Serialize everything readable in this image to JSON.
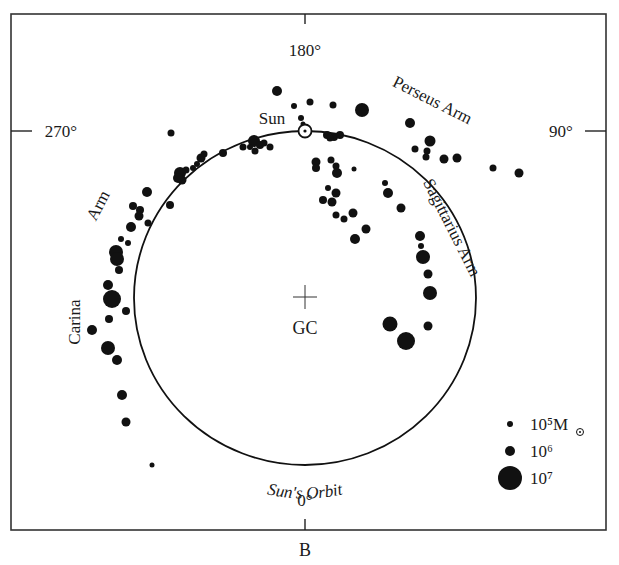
{
  "figure": {
    "panel_label": "B",
    "frame": {
      "x": 11,
      "y": 14,
      "width": 595,
      "height": 516
    },
    "colors": {
      "ink": "#111111",
      "background": "#ffffff",
      "frame": "#333333"
    }
  },
  "axes": {
    "top": {
      "label": "180°",
      "tick": {
        "x": 305,
        "y1": 14,
        "y2": 24
      },
      "text_x": 305,
      "text_y": 56
    },
    "left": {
      "label": "270°",
      "tick": {
        "y": 131,
        "x1": 11,
        "x2": 32
      },
      "text_x": 61,
      "text_y": 137
    },
    "right": {
      "label": "90°",
      "tick": {
        "y": 131,
        "x1": 585,
        "x2": 606
      },
      "text_x": 561,
      "text_y": 137
    },
    "bottom": {
      "label": "0°",
      "tick": {
        "x": 305,
        "y1": 519,
        "y2": 530
      },
      "text_x": 305,
      "text_y": 506
    }
  },
  "orbit": {
    "label": "Sun's Orbit",
    "cx": 305,
    "cy": 298,
    "rx": 171,
    "ry": 167
  },
  "galactic_center": {
    "label": "GC",
    "x": 305,
    "y": 297,
    "arm": 12
  },
  "sun": {
    "label": "Sun",
    "x": 305,
    "y": 131,
    "label_x": 272,
    "label_y": 124
  },
  "arm_labels": [
    {
      "id": "perseus",
      "text": "Perseus Arm",
      "x": 430,
      "y": 105,
      "rotate": 27
    },
    {
      "id": "sagittarius",
      "text": "Sagittarius Arm",
      "x": 447,
      "y": 230,
      "rotate": 63
    },
    {
      "id": "carina-arm",
      "text": "Arm",
      "x": 103,
      "y": 208,
      "rotate": -62
    },
    {
      "id": "carina",
      "text": "Carina",
      "x": 80,
      "y": 322,
      "rotate": -90
    }
  ],
  "legend": {
    "unit_symbol": "☉",
    "items": [
      {
        "label": "10⁵M",
        "dot_r": 3,
        "x": 510,
        "y": 424,
        "text_x": 530,
        "text_y": 430
      },
      {
        "label": "10⁶",
        "dot_r": 5,
        "x": 510,
        "y": 451,
        "text_x": 530,
        "text_y": 457
      },
      {
        "label": "10⁷",
        "dot_r": 12,
        "x": 510,
        "y": 478,
        "text_x": 530,
        "text_y": 484
      }
    ]
  },
  "chart_data": {
    "type": "scatter",
    "xlabel": "Galactic longitude (face-on view)",
    "ylabel": "",
    "annotations": [
      "180°",
      "270°",
      "90°",
      "0°",
      "Sun",
      "GC",
      "Sun's Orbit",
      "Perseus Arm",
      "Sagittarius Arm",
      "Carina Arm",
      "B"
    ],
    "legend": [
      {
        "mass": "1e5 Msun",
        "marker_radius": 3
      },
      {
        "mass": "1e6 Msun",
        "marker_radius": 5
      },
      {
        "mass": "1e7 Msun",
        "marker_radius": 12
      }
    ],
    "points": [
      {
        "x": 277,
        "y": 91,
        "r": 5
      },
      {
        "x": 294,
        "y": 106,
        "r": 3
      },
      {
        "x": 310,
        "y": 102,
        "r": 3.5
      },
      {
        "x": 333,
        "y": 105,
        "r": 3.5
      },
      {
        "x": 362,
        "y": 110,
        "r": 7
      },
      {
        "x": 301,
        "y": 118,
        "r": 3
      },
      {
        "x": 303,
        "y": 124,
        "r": 2.5
      },
      {
        "x": 171,
        "y": 133,
        "r": 3.5
      },
      {
        "x": 254,
        "y": 141,
        "r": 6
      },
      {
        "x": 260,
        "y": 145,
        "r": 4
      },
      {
        "x": 264,
        "y": 143,
        "r": 3.5
      },
      {
        "x": 270,
        "y": 147,
        "r": 3.5
      },
      {
        "x": 255,
        "y": 151,
        "r": 3.5
      },
      {
        "x": 250,
        "y": 147,
        "r": 3
      },
      {
        "x": 243,
        "y": 147,
        "r": 3.5
      },
      {
        "x": 223,
        "y": 153,
        "r": 4
      },
      {
        "x": 201,
        "y": 158,
        "r": 4.5
      },
      {
        "x": 204,
        "y": 154,
        "r": 3.5
      },
      {
        "x": 197,
        "y": 164,
        "r": 3
      },
      {
        "x": 193,
        "y": 168,
        "r": 3
      },
      {
        "x": 180,
        "y": 173,
        "r": 6
      },
      {
        "x": 182,
        "y": 180,
        "r": 4.5
      },
      {
        "x": 186,
        "y": 170,
        "r": 3.5
      },
      {
        "x": 178,
        "y": 178,
        "r": 5
      },
      {
        "x": 170,
        "y": 205,
        "r": 4
      },
      {
        "x": 147,
        "y": 192,
        "r": 5
      },
      {
        "x": 133,
        "y": 206,
        "r": 4
      },
      {
        "x": 140,
        "y": 210,
        "r": 4
      },
      {
        "x": 139,
        "y": 216,
        "r": 4.5
      },
      {
        "x": 148,
        "y": 223,
        "r": 3.5
      },
      {
        "x": 131,
        "y": 227,
        "r": 5
      },
      {
        "x": 121,
        "y": 239,
        "r": 3
      },
      {
        "x": 128,
        "y": 243,
        "r": 3
      },
      {
        "x": 116,
        "y": 252,
        "r": 7
      },
      {
        "x": 117,
        "y": 259,
        "r": 7
      },
      {
        "x": 119,
        "y": 270,
        "r": 4
      },
      {
        "x": 108,
        "y": 285,
        "r": 5
      },
      {
        "x": 112,
        "y": 299,
        "r": 9
      },
      {
        "x": 126,
        "y": 311,
        "r": 4
      },
      {
        "x": 109,
        "y": 319,
        "r": 4
      },
      {
        "x": 92,
        "y": 330,
        "r": 5
      },
      {
        "x": 108,
        "y": 348,
        "r": 7
      },
      {
        "x": 117,
        "y": 360,
        "r": 5
      },
      {
        "x": 122,
        "y": 395,
        "r": 5
      },
      {
        "x": 126,
        "y": 422,
        "r": 4.5
      },
      {
        "x": 152,
        "y": 465,
        "r": 2.5
      },
      {
        "x": 327,
        "y": 135,
        "r": 4
      },
      {
        "x": 334,
        "y": 137,
        "r": 4
      },
      {
        "x": 340,
        "y": 135,
        "r": 4
      },
      {
        "x": 330,
        "y": 138,
        "r": 3.5
      },
      {
        "x": 316,
        "y": 162,
        "r": 4.5
      },
      {
        "x": 316,
        "y": 168,
        "r": 4
      },
      {
        "x": 331,
        "y": 160,
        "r": 3.5
      },
      {
        "x": 336,
        "y": 166,
        "r": 3.5
      },
      {
        "x": 337,
        "y": 173,
        "r": 5
      },
      {
        "x": 354,
        "y": 169,
        "r": 2.5
      },
      {
        "x": 328,
        "y": 188,
        "r": 3
      },
      {
        "x": 336,
        "y": 193,
        "r": 4.5
      },
      {
        "x": 323,
        "y": 200,
        "r": 4
      },
      {
        "x": 332,
        "y": 202,
        "r": 4.5
      },
      {
        "x": 336,
        "y": 215,
        "r": 3.5
      },
      {
        "x": 344,
        "y": 219,
        "r": 3.5
      },
      {
        "x": 353,
        "y": 213,
        "r": 4.5
      },
      {
        "x": 355,
        "y": 239,
        "r": 5
      },
      {
        "x": 366,
        "y": 229,
        "r": 4.5
      },
      {
        "x": 410,
        "y": 123,
        "r": 5
      },
      {
        "x": 430,
        "y": 141,
        "r": 5.5
      },
      {
        "x": 415,
        "y": 149,
        "r": 3.5
      },
      {
        "x": 427,
        "y": 151,
        "r": 3.5
      },
      {
        "x": 426,
        "y": 157,
        "r": 3.5
      },
      {
        "x": 444,
        "y": 159,
        "r": 4.5
      },
      {
        "x": 457,
        "y": 158,
        "r": 4.5
      },
      {
        "x": 493,
        "y": 168,
        "r": 3.5
      },
      {
        "x": 519,
        "y": 173,
        "r": 4.5
      },
      {
        "x": 385,
        "y": 183,
        "r": 3
      },
      {
        "x": 388,
        "y": 193,
        "r": 5
      },
      {
        "x": 401,
        "y": 208,
        "r": 4.5
      },
      {
        "x": 420,
        "y": 236,
        "r": 5
      },
      {
        "x": 421,
        "y": 246,
        "r": 3
      },
      {
        "x": 423,
        "y": 257,
        "r": 7
      },
      {
        "x": 428,
        "y": 274,
        "r": 4.5
      },
      {
        "x": 430,
        "y": 293,
        "r": 7
      },
      {
        "x": 390,
        "y": 324,
        "r": 7.5
      },
      {
        "x": 428,
        "y": 326,
        "r": 4.5
      },
      {
        "x": 406,
        "y": 341,
        "r": 9
      }
    ]
  }
}
